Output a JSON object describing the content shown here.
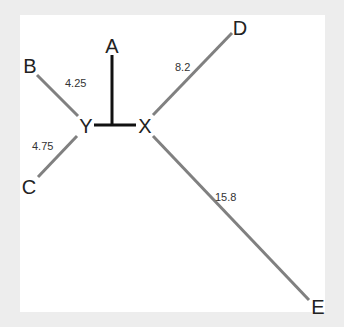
{
  "diagram": {
    "type": "phylogenetic-tree",
    "colors": {
      "background": "#ededed",
      "canvas": "#ffffff",
      "internal_edge": "#111111",
      "leaf_edge": "#808080",
      "text": "#222222"
    },
    "nodes": {
      "A": {
        "label": "A"
      },
      "B": {
        "label": "B"
      },
      "C": {
        "label": "C"
      },
      "D": {
        "label": "D"
      },
      "E": {
        "label": "E"
      },
      "X": {
        "label": "X"
      },
      "Y": {
        "label": "Y"
      }
    },
    "edges": [
      {
        "from": "Y",
        "to": "B",
        "length_label": "4.25"
      },
      {
        "from": "Y",
        "to": "C",
        "length_label": "4.75"
      },
      {
        "from": "X",
        "to": "D",
        "length_label": "8.2"
      },
      {
        "from": "X",
        "to": "E",
        "length_label": "15.8"
      },
      {
        "from": "Y",
        "to": "X",
        "length_label": ""
      },
      {
        "from": "YX-mid",
        "to": "A",
        "length_label": ""
      }
    ]
  }
}
